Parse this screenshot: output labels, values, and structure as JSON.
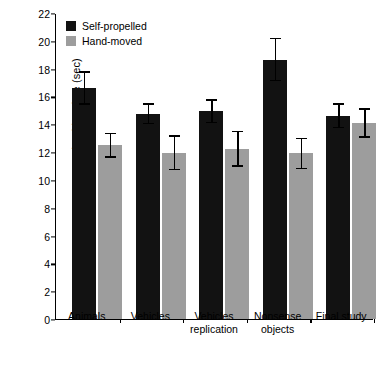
{
  "chart_data": {
    "type": "bar",
    "title": "",
    "xlabel": "",
    "ylabel": "Looking time (sec)",
    "ylim": [
      0,
      22
    ],
    "ytick_step": 2,
    "yticks": [
      "0",
      "2",
      "4",
      "6",
      "8",
      "10",
      "12",
      "14",
      "16",
      "18",
      "20",
      "22"
    ],
    "grid": false,
    "legend_position": "top-left",
    "categories": [
      "Animals",
      "Vehicles",
      "Vehicles replication",
      "Nonsense objects",
      "Final study"
    ],
    "category_lines": [
      [
        "Animals"
      ],
      [
        "Vehicles"
      ],
      [
        "Vehicles",
        "replication"
      ],
      [
        "Nonsense",
        "objects"
      ],
      [
        "Final study"
      ]
    ],
    "series": [
      {
        "name": "Self-propelled",
        "color": "#121212",
        "values": [
          16.6,
          14.75,
          14.95,
          18.65,
          14.6
        ],
        "err_low": [
          1.2,
          0.75,
          0.85,
          1.55,
          0.9
        ],
        "err_high": [
          1.2,
          0.75,
          0.85,
          1.55,
          0.9
        ]
      },
      {
        "name": "Hand-moved",
        "color": "#9d9d9d",
        "values": [
          12.5,
          11.95,
          12.25,
          11.9,
          14.1
        ],
        "err_low": [
          0.9,
          1.25,
          1.3,
          1.15,
          1.05
        ],
        "err_high": [
          0.9,
          1.25,
          1.3,
          1.15,
          1.05
        ]
      }
    ]
  }
}
